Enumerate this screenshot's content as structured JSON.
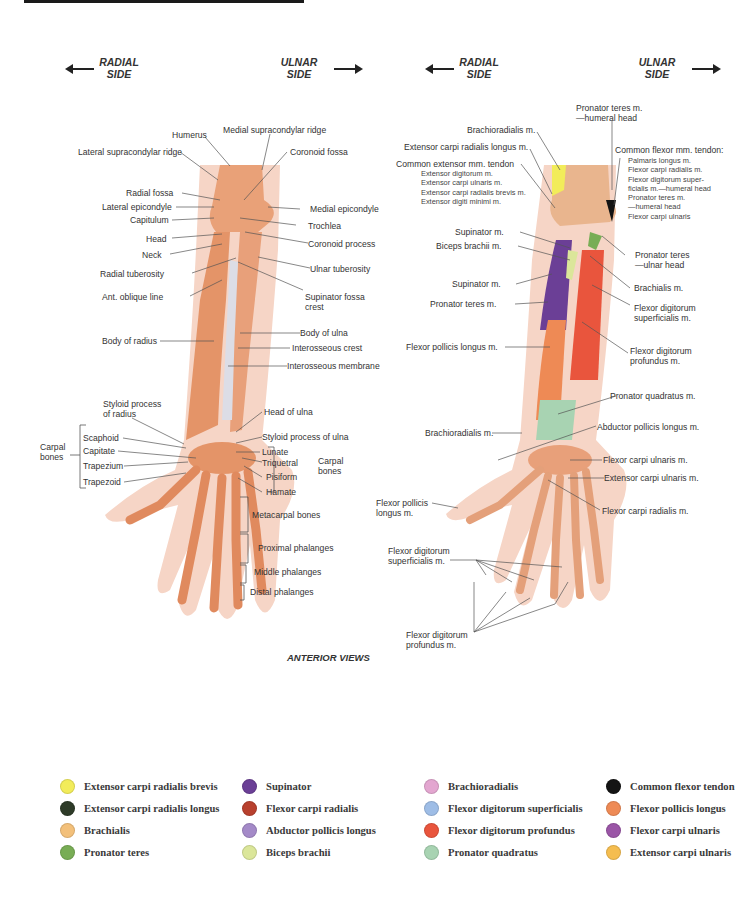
{
  "header": {
    "left_figure": {
      "radial": "RADIAL\nSIDE",
      "ulnar": "ULNAR\nSIDE"
    },
    "right_figure": {
      "radial": "RADIAL\nSIDE",
      "ulnar": "ULNAR\nSIDE"
    }
  },
  "left_labels": {
    "humerus": "Humerus",
    "medial_supracondylar_ridge": "Medial supracondylar ridge",
    "lateral_supracondylar_ridge": "Lateral supracondylar ridge",
    "coronoid_fossa": "Coronoid fossa",
    "radial_fossa": "Radial fossa",
    "lateral_epicondyle": "Lateral epicondyle",
    "medial_epicondyle": "Medial epicondyle",
    "capitulum": "Capitulum",
    "trochlea": "Trochlea",
    "head": "Head",
    "coronoid_process": "Coronoid process",
    "neck": "Neck",
    "radial_tuberosity": "Radial tuberosity",
    "ulnar_tuberosity": "Ulnar tuberosity",
    "ant_oblique_line": "Ant. oblique line",
    "supinator_fossa_crest_1": "Supinator fossa",
    "supinator_fossa_crest_2": "crest",
    "body_of_ulna": "Body of ulna",
    "body_of_radius": "Body of radius",
    "interosseous_crest": "Interosseous crest",
    "interosseous_membrane": "Interosseous membrane",
    "styloid_radius_1": "Styloid process",
    "styloid_radius_2": "of radius",
    "head_of_ulna": "Head of ulna",
    "styloid_ulna": "Styloid process of ulna",
    "carpal_bones_left_1": "Carpal",
    "carpal_bones_left_2": "bones",
    "scaphoid": "Scaphoid",
    "capitate": "Capitate",
    "trapezium": "Trapezium",
    "trapezoid": "Trapezoid",
    "lunate": "Lunate",
    "triquetral": "Triquetral",
    "pisiform": "Pisiform",
    "hamate": "Hamate",
    "carpal_bones_right_1": "Carpal",
    "carpal_bones_right_2": "bones",
    "metacarpal_bones": "Metacarpal bones",
    "proximal_phalanges": "Proximal phalanges",
    "middle_phalanges": "Middle phalanges",
    "distal_phalanges": "Distal phalanges"
  },
  "right_labels": {
    "pronator_teres_humeral_1": "Pronator teres m.",
    "pronator_teres_humeral_2": "—humeral head",
    "brachioradialis_top": "Brachioradialis m.",
    "ecrl": "Extensor carpi radialis longus m.",
    "common_extensor": "Common extensor mm. tendon",
    "common_extensor_items": [
      "Extensor digitorum m.",
      "Extensor carpi ulnaris m.",
      "Extensor carpi radialis brevis m.",
      "Extensor digiti minimi m."
    ],
    "common_flexor": "Common flexor mm. tendon:",
    "common_flexor_items": [
      "Palmaris longus m.",
      "Flexor carpi radialis m.",
      "Flexor digitorum super-",
      "ficialis m.—humeral head",
      "Pronator teres m.",
      "—humeral head",
      "Flexor carpi ulnaris"
    ],
    "supinator_top": "Supinator m.",
    "biceps_brachii": "Biceps brachii m.",
    "pronator_teres_ulnar_1": "Pronator teres",
    "pronator_teres_ulnar_2": "—ulnar head",
    "supinator_mid": "Supinator m.",
    "brachialis": "Brachialis m.",
    "pronator_teres": "Pronator teres m.",
    "fds_1": "Flexor digitorum",
    "fds_2": "superficialis m.",
    "fpl": "Flexor pollicis longus m.",
    "fdp_1": "Flexor digitorum",
    "fdp_2": "profundus m.",
    "pronator_quadratus": "Pronator quadratus m.",
    "brachioradialis_low": "Brachioradialis m.",
    "apl": "Abductor pollicis longus m.",
    "fcu": "Flexor carpi ulnaris m.",
    "ecu": "Extensor carpi ulnaris m.",
    "fpl_hand_1": "Flexor pollicis",
    "fpl_hand_2": "longus m.",
    "fcr": "Flexor carpi radialis m.",
    "fds_hand_1": "Flexor digitorum",
    "fds_hand_2": "superficialis m.",
    "fdp_hand_1": "Flexor digitorum",
    "fdp_hand_2": "profundus m."
  },
  "caption": "ANTERIOR VIEWS",
  "legend": [
    {
      "label": "Extensor carpi radialis brevis",
      "color": "#f2ec5a"
    },
    {
      "label": "Supinator",
      "color": "#6b3f96"
    },
    {
      "label": "Brachioradialis",
      "color": "#e3a6d0"
    },
    {
      "label": "Common flexor tendon",
      "color": "#141414"
    },
    {
      "label": "Extensor carpi radialis longus",
      "color": "#2e3b28"
    },
    {
      "label": "Flexor carpi radialis",
      "color": "#b8402e"
    },
    {
      "label": "Flexor digitorum superficialis",
      "color": "#9ebde6"
    },
    {
      "label": "Flexor pollicis longus",
      "color": "#ee8a55"
    },
    {
      "label": "Brachialis",
      "color": "#f3c07a"
    },
    {
      "label": "Abductor pollicis longus",
      "color": "#a48ac8"
    },
    {
      "label": "Flexor digitorum profundus",
      "color": "#e9553d"
    },
    {
      "label": "Flexor carpi ulnaris",
      "color": "#9a55a6"
    },
    {
      "label": "Pronator teres",
      "color": "#78ad55"
    },
    {
      "label": "Biceps brachii",
      "color": "#dbe69a"
    },
    {
      "label": "Pronator quadratus",
      "color": "#a8d3b2"
    },
    {
      "label": "Extensor carpi ulnaris",
      "color": "#f5bd4f"
    }
  ]
}
